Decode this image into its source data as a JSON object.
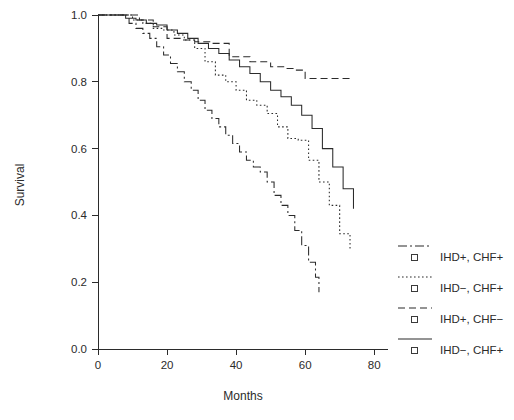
{
  "chart_data": {
    "type": "line",
    "subtype": "kaplan-meier-step",
    "title": "",
    "xlabel": "Months",
    "ylabel": "Survival",
    "xlim": [
      0,
      84
    ],
    "ylim": [
      0.0,
      1.0
    ],
    "grid": false,
    "legend_position": "right",
    "xticks": [
      0,
      20,
      40,
      60,
      80
    ],
    "xtick_labels": [
      "0",
      "20",
      "40",
      "60",
      "80"
    ],
    "yticks": [
      0.0,
      0.2,
      0.4,
      0.6,
      0.8,
      1.0
    ],
    "ytick_labels": [
      "0.0",
      "0.2",
      "0.4",
      "0.6",
      "0.8",
      "1.0"
    ],
    "series": [
      {
        "name": "IHD+, CHF+",
        "linestyle": "dashdot",
        "dasharray": "9,3,2,3",
        "x": [
          0,
          5,
          9,
          11,
          13,
          15,
          17,
          19,
          21,
          23,
          25,
          27,
          29,
          31,
          33,
          35,
          37,
          39,
          41,
          43,
          45,
          47,
          49,
          51,
          53,
          55,
          57,
          59,
          61,
          63,
          64
        ],
        "y": [
          1.0,
          1.0,
          0.975,
          0.96,
          0.945,
          0.93,
          0.905,
          0.88,
          0.855,
          0.83,
          0.8,
          0.775,
          0.745,
          0.715,
          0.69,
          0.665,
          0.64,
          0.615,
          0.59,
          0.565,
          0.545,
          0.53,
          0.5,
          0.46,
          0.43,
          0.4,
          0.355,
          0.31,
          0.26,
          0.215,
          0.17
        ]
      },
      {
        "name": "IHD−, CHF+",
        "linestyle": "dotted",
        "dasharray": "1.6,2.4",
        "x": [
          0,
          6,
          10,
          13,
          16,
          19,
          22,
          25,
          28,
          31,
          34,
          37,
          40,
          43,
          46,
          49,
          52,
          55,
          58,
          61,
          64,
          67,
          70,
          73
        ],
        "y": [
          1.0,
          1.0,
          0.985,
          0.975,
          0.96,
          0.955,
          0.94,
          0.925,
          0.9,
          0.86,
          0.82,
          0.8,
          0.775,
          0.745,
          0.73,
          0.705,
          0.665,
          0.63,
          0.625,
          0.565,
          0.5,
          0.43,
          0.345,
          0.3
        ]
      },
      {
        "name": "IHD+, CHF−",
        "linestyle": "dashed",
        "dasharray": "7,4",
        "x": [
          0,
          7,
          12,
          16,
          20,
          24,
          28,
          33,
          38,
          44,
          50,
          54,
          57,
          60,
          63,
          66,
          70,
          74
        ],
        "y": [
          1.0,
          1.0,
          0.985,
          0.965,
          0.93,
          0.925,
          0.92,
          0.915,
          0.875,
          0.86,
          0.845,
          0.84,
          0.835,
          0.81,
          0.81,
          0.81,
          0.81,
          0.81
        ]
      },
      {
        "name": "IHD−, CHF+",
        "linestyle": "solid",
        "dasharray": "none",
        "x": [
          0,
          4,
          8,
          11,
          14,
          17,
          20,
          23,
          26,
          29,
          32,
          35,
          38,
          41,
          44,
          47,
          50,
          53,
          56,
          59,
          62,
          65,
          68,
          71,
          74
        ],
        "y": [
          1.0,
          1.0,
          0.99,
          0.985,
          0.975,
          0.97,
          0.955,
          0.945,
          0.93,
          0.915,
          0.9,
          0.885,
          0.865,
          0.845,
          0.825,
          0.8,
          0.775,
          0.755,
          0.73,
          0.7,
          0.66,
          0.6,
          0.545,
          0.48,
          0.42
        ]
      }
    ],
    "legend_entries": [
      {
        "label": "IHD+, CHF+",
        "linestyle": "dashdot",
        "marker": "square"
      },
      {
        "label": "IHD−, CHF+",
        "linestyle": "dotted",
        "marker": "square"
      },
      {
        "label": "IHD+, CHF−",
        "linestyle": "dashed",
        "marker": "square"
      },
      {
        "label": "IHD−, CHF+",
        "linestyle": "solid",
        "marker": "square"
      }
    ],
    "colors": {
      "axis": "#2b2b2b",
      "curve": "#2b2b2b",
      "background": "#ffffff"
    }
  }
}
